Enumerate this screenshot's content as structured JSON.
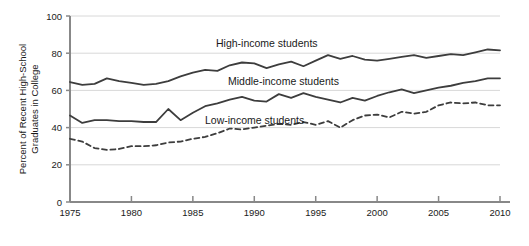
{
  "chart_data": {
    "type": "line",
    "title": "",
    "subtitle": "",
    "xlabel": "",
    "ylabel": "Percent of Recent High-School Graduates in College",
    "ylabel_line1": "Percent of Recent High-School",
    "ylabel_line2": "Graduates in College",
    "xlim": [
      1975,
      2010
    ],
    "ylim": [
      0,
      100
    ],
    "yticks": [
      0,
      20,
      40,
      60,
      80,
      100
    ],
    "ytick_labels": [
      "0",
      "20",
      "40",
      "60",
      "80",
      "100"
    ],
    "xticks": [
      1975,
      1980,
      1985,
      1990,
      1995,
      2000,
      2005,
      2010
    ],
    "xtick_labels": [
      "1975",
      "1980",
      "1985",
      "1990",
      "1995",
      "2000",
      "2005",
      "2010"
    ],
    "grid": "horizontal",
    "legend_position": "inline-annotations",
    "x": [
      1975,
      1976,
      1977,
      1978,
      1979,
      1980,
      1981,
      1982,
      1983,
      1984,
      1985,
      1986,
      1987,
      1988,
      1989,
      1990,
      1991,
      1992,
      1993,
      1994,
      1995,
      1996,
      1997,
      1998,
      1999,
      2000,
      2001,
      2002,
      2003,
      2004,
      2005,
      2006,
      2007,
      2008,
      2009,
      2010
    ],
    "series": [
      {
        "name": "High-income students",
        "style": "solid",
        "color": "#3d3d3d",
        "annotation": "High-income students",
        "values": [
          64.5,
          63.0,
          63.5,
          66.5,
          65.0,
          64.0,
          63.0,
          63.5,
          65.0,
          67.5,
          69.5,
          71.0,
          70.5,
          73.5,
          75.0,
          74.5,
          72.0,
          74.0,
          75.5,
          73.0,
          76.0,
          79.0,
          77.0,
          78.5,
          76.5,
          76.0,
          77.0,
          78.0,
          79.0,
          77.5,
          78.5,
          79.5,
          79.0,
          80.5,
          82.0,
          81.5
        ]
      },
      {
        "name": "Middle-income students",
        "style": "solid",
        "color": "#3d3d3d",
        "annotation": "Middle-income students",
        "values": [
          46.5,
          42.5,
          44.0,
          44.0,
          43.5,
          43.5,
          43.0,
          43.0,
          50.0,
          44.0,
          48.0,
          51.5,
          53.0,
          55.0,
          56.5,
          54.5,
          54.0,
          58.0,
          56.0,
          58.5,
          56.5,
          55.0,
          53.5,
          56.0,
          54.5,
          57.0,
          59.0,
          60.5,
          58.5,
          60.0,
          61.5,
          62.5,
          64.0,
          65.0,
          66.5,
          66.5
        ]
      },
      {
        "name": "Low-income students",
        "style": "dashed",
        "color": "#3d3d3d",
        "annotation": "Low-income students",
        "values": [
          34.0,
          32.5,
          29.0,
          28.0,
          28.5,
          30.0,
          30.0,
          30.5,
          32.0,
          32.5,
          34.0,
          35.0,
          37.0,
          39.5,
          39.0,
          40.0,
          41.0,
          42.0,
          41.5,
          43.0,
          41.5,
          43.5,
          40.0,
          44.0,
          46.5,
          47.0,
          45.5,
          48.5,
          47.5,
          48.5,
          52.0,
          53.5,
          53.0,
          53.5,
          52.0,
          52.0
        ]
      }
    ]
  }
}
